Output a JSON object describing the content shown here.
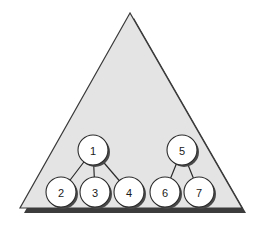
{
  "figure": {
    "canvas": {
      "width": 264,
      "height": 230,
      "background": "#ffffff"
    },
    "shape": {
      "name": "triangle",
      "kind": "isosceles-triangle",
      "apex": {
        "x": 130,
        "y": 13
      },
      "bottom_left": {
        "x": 20,
        "y": 208
      },
      "bottom_right": {
        "x": 242,
        "y": 208
      },
      "fill": "#e4e4e4",
      "stroke": "#3a3a3a",
      "stroke_width": 1.2,
      "shadow_color": "#3c3c3c",
      "shadow_offset": {
        "x": 4,
        "y": 5
      }
    },
    "nodes": [
      {
        "id": "node-1",
        "label": "1",
        "x": 93,
        "y": 150,
        "r": 15
      },
      {
        "id": "node-2",
        "label": "2",
        "x": 61,
        "y": 192,
        "r": 15
      },
      {
        "id": "node-3",
        "label": "3",
        "x": 95,
        "y": 192,
        "r": 15
      },
      {
        "id": "node-4",
        "label": "4",
        "x": 129,
        "y": 192,
        "r": 15
      },
      {
        "id": "node-5",
        "label": "5",
        "x": 182,
        "y": 150,
        "r": 15
      },
      {
        "id": "node-6",
        "label": "6",
        "x": 165,
        "y": 192,
        "r": 15
      },
      {
        "id": "node-7",
        "label": "7",
        "x": 199,
        "y": 192,
        "r": 15
      }
    ],
    "edges": [
      {
        "id": "edge-1-2",
        "from": "node-1",
        "to": "node-2"
      },
      {
        "id": "edge-1-3",
        "from": "node-1",
        "to": "node-3"
      },
      {
        "id": "edge-1-4",
        "from": "node-1",
        "to": "node-4"
      },
      {
        "id": "edge-5-6",
        "from": "node-5",
        "to": "node-6"
      },
      {
        "id": "edge-5-7",
        "from": "node-5",
        "to": "node-7"
      }
    ],
    "node_style": {
      "fill": "#ffffff",
      "stroke": "#2b2b2b",
      "stroke_width": 1.1,
      "shadow_color": "#4a4a4a",
      "shadow_offset": {
        "x": 2,
        "y": 2
      },
      "label_color": "#1a1a1a",
      "label_size": 11
    },
    "edge_style": {
      "stroke": "#2b2b2b",
      "stroke_width": 1.2
    }
  }
}
